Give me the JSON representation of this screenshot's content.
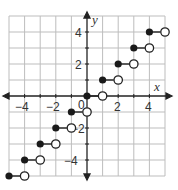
{
  "chart_data": {
    "type": "scatter",
    "title": "",
    "subtitle": "",
    "xlabel": "x",
    "ylabel": "y",
    "xlim": [
      -5,
      5
    ],
    "ylim": [
      -5,
      5
    ],
    "grid": true,
    "legend": null,
    "x_ticks": [
      -4,
      -2,
      0,
      2,
      4
    ],
    "y_ticks": [
      4,
      2,
      -2,
      -4
    ],
    "x_tick_labels": [
      "−4",
      "−2",
      "0",
      "2",
      "4"
    ],
    "y_tick_labels": [
      "4",
      "2",
      "−2",
      "−4"
    ],
    "segments": [
      {
        "start": [
          -5,
          -5
        ],
        "end": [
          -4,
          -5
        ],
        "start_closed": true,
        "end_closed": false
      },
      {
        "start": [
          -4,
          -4
        ],
        "end": [
          -3,
          -4
        ],
        "start_closed": true,
        "end_closed": false
      },
      {
        "start": [
          -3,
          -3
        ],
        "end": [
          -2,
          -3
        ],
        "start_closed": true,
        "end_closed": false
      },
      {
        "start": [
          -2,
          -2
        ],
        "end": [
          -1,
          -2
        ],
        "start_closed": true,
        "end_closed": false
      },
      {
        "start": [
          -1,
          -1
        ],
        "end": [
          0,
          -1
        ],
        "start_closed": true,
        "end_closed": false
      },
      {
        "start": [
          0,
          0
        ],
        "end": [
          1,
          0
        ],
        "start_closed": true,
        "end_closed": false
      },
      {
        "start": [
          1,
          1
        ],
        "end": [
          2,
          1
        ],
        "start_closed": true,
        "end_closed": false
      },
      {
        "start": [
          2,
          2
        ],
        "end": [
          3,
          2
        ],
        "start_closed": true,
        "end_closed": false
      },
      {
        "start": [
          3,
          3
        ],
        "end": [
          4,
          3
        ],
        "start_closed": true,
        "end_closed": false
      },
      {
        "start": [
          4,
          4
        ],
        "end": [
          5,
          4
        ],
        "start_closed": true,
        "end_closed": false
      }
    ]
  },
  "labels": {
    "x_axis": "x",
    "y_axis": "y",
    "origin": "0",
    "xt_m4": "−4",
    "xt_m2": "−2",
    "xt_2": "2",
    "xt_4": "4",
    "yt_4": "4",
    "yt_2": "2",
    "yt_m2": "−2",
    "yt_m4": "−4"
  }
}
